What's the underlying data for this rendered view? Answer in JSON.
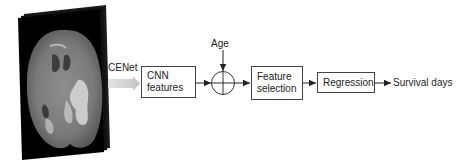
{
  "diagram": {
    "input": {
      "name": "Brain MRI slice stack",
      "edge_label": "CENet"
    },
    "nodes": {
      "cnn_features": {
        "line1": "CNN",
        "line2": "features"
      },
      "age": {
        "label": "Age"
      },
      "sum_junction": {
        "symbol": "circled-plus"
      },
      "feature_selection": {
        "line1": "Feature",
        "line2": "selection"
      },
      "regression": {
        "label": "Regression"
      },
      "output": {
        "label": "Survival days"
      }
    },
    "edges": [
      {
        "from": "Brain MRI slice stack",
        "to": "CNN features",
        "label": "CENet",
        "style": "wide-gray-arrow"
      },
      {
        "from": "CNN features",
        "to": "circled-plus"
      },
      {
        "from": "Age",
        "to": "circled-plus"
      },
      {
        "from": "circled-plus",
        "to": "Feature selection"
      },
      {
        "from": "Feature selection",
        "to": "Regression"
      },
      {
        "from": "Regression",
        "to": "Survival days"
      }
    ],
    "colors": {
      "stroke": "#444444",
      "text": "#222222",
      "wide_arrow": "#cfcfcf"
    }
  }
}
